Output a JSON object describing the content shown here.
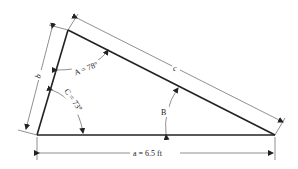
{
  "diagram": {
    "type": "triangle",
    "vertices": {
      "top": [
        68,
        30
      ],
      "bottom_left": [
        37,
        135
      ],
      "bottom_right": [
        275,
        135
      ]
    },
    "sides": {
      "a": {
        "label": "a = 6.5 ft"
      },
      "b": {
        "label": "b"
      },
      "c": {
        "label": "c"
      }
    },
    "angles": {
      "A": {
        "label": "A = 78°"
      },
      "B": {
        "label": "B"
      },
      "C": {
        "label": "C = 73°"
      }
    }
  }
}
